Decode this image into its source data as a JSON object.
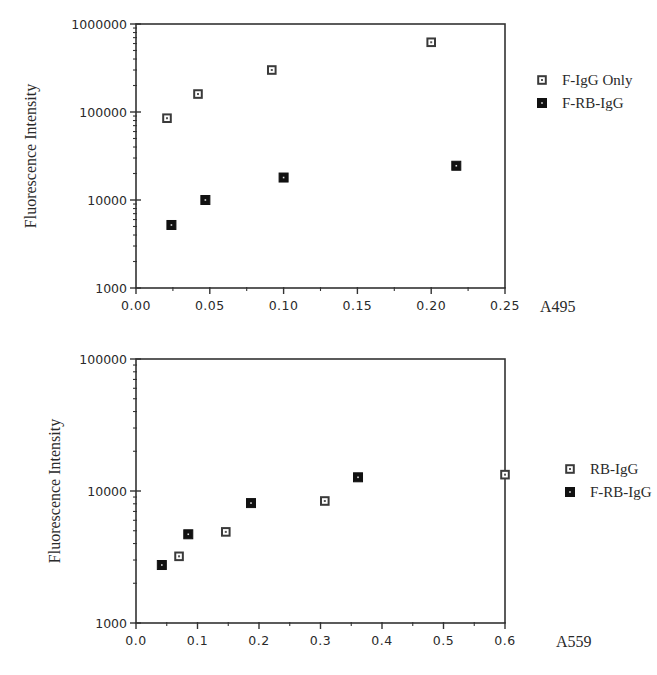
{
  "chart_data": [
    {
      "type": "scatter",
      "title": "",
      "xlabel": "A495",
      "ylabel": "Fluorescence Intensity",
      "yscale": "log",
      "xlim": [
        0.0,
        0.25
      ],
      "ylim": [
        1000,
        1000000
      ],
      "xticks": [
        0.0,
        0.05,
        0.1,
        0.15,
        0.2,
        0.25
      ],
      "xtick_labels": [
        "0.00",
        "0.05",
        "0.10",
        "0.15",
        "0.20",
        "0.25"
      ],
      "yticks": [
        1000,
        10000,
        100000,
        1000000
      ],
      "ytick_labels": [
        "1000",
        "10000",
        "100000",
        "1000000"
      ],
      "grid": false,
      "legend": "right",
      "series": [
        {
          "name": "F-IgG Only",
          "marker": "open-square",
          "color": "#555555",
          "x": [
            0.021,
            0.042,
            0.092,
            0.2
          ],
          "y": [
            85000,
            160000,
            300000,
            620000
          ]
        },
        {
          "name": "F-RB-IgG",
          "marker": "filled-square",
          "color": "#111111",
          "x": [
            0.024,
            0.047,
            0.1,
            0.217
          ],
          "y": [
            5200,
            10000,
            18000,
            24500
          ]
        }
      ]
    },
    {
      "type": "scatter",
      "title": "",
      "xlabel": "A559",
      "ylabel": "Fluorescence Intensity",
      "yscale": "log",
      "xlim": [
        0.0,
        0.6
      ],
      "ylim": [
        1000,
        100000
      ],
      "xticks": [
        0.0,
        0.1,
        0.2,
        0.3,
        0.4,
        0.5,
        0.6
      ],
      "xtick_labels": [
        "0.0",
        "0.1",
        "0.2",
        "0.3",
        "0.4",
        "0.5",
        "0.6"
      ],
      "yticks": [
        1000,
        10000,
        100000
      ],
      "ytick_labels": [
        "1000",
        "10000",
        "100000"
      ],
      "grid": false,
      "legend": "right",
      "series": [
        {
          "name": "RB-IgG",
          "marker": "open-square",
          "color": "#555555",
          "x": [
            0.07,
            0.146,
            0.307,
            0.6
          ],
          "y": [
            3200,
            4900,
            8400,
            13300
          ]
        },
        {
          "name": "F-RB-IgG",
          "marker": "filled-square",
          "color": "#111111",
          "x": [
            0.042,
            0.085,
            0.187,
            0.361
          ],
          "y": [
            2750,
            4700,
            8100,
            12700
          ]
        }
      ]
    }
  ]
}
